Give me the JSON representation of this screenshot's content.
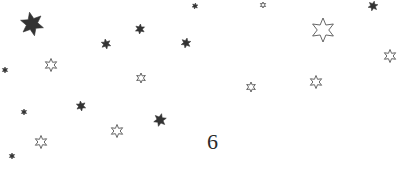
{
  "page": {
    "number": "6",
    "ink_color": "#333333",
    "outline_color": "#555555"
  },
  "decorations": {
    "stars": [
      {
        "style": "filled",
        "size": "large"
      },
      {
        "style": "filled",
        "size": "tiny"
      },
      {
        "style": "outline",
        "size": "tiny"
      },
      {
        "style": "filled",
        "size": "small"
      },
      {
        "style": "filled",
        "size": "small"
      },
      {
        "style": "filled",
        "size": "small"
      },
      {
        "style": "filled",
        "size": "small"
      },
      {
        "style": "outline",
        "size": "large"
      },
      {
        "style": "outline",
        "size": "medium"
      },
      {
        "style": "filled",
        "size": "tiny"
      },
      {
        "style": "outline",
        "size": "medium"
      },
      {
        "style": "outline",
        "size": "small"
      },
      {
        "style": "outline",
        "size": "small"
      },
      {
        "style": "outline",
        "size": "medium"
      },
      {
        "style": "filled",
        "size": "tiny"
      },
      {
        "style": "filled",
        "size": "small"
      },
      {
        "style": "filled",
        "size": "medium"
      },
      {
        "style": "outline",
        "size": "medium"
      },
      {
        "style": "outline",
        "size": "medium"
      },
      {
        "style": "filled",
        "size": "tiny"
      }
    ]
  }
}
